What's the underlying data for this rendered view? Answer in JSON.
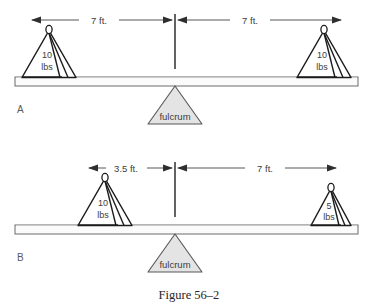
{
  "figure": {
    "caption": "Figure 56–2",
    "panels": [
      {
        "id": "A",
        "label": "A",
        "balanced": true,
        "fulcrum_label": "fulcrum",
        "dimensions": [
          {
            "side": "left",
            "label": "7 ft."
          },
          {
            "side": "right",
            "label": "7 ft."
          }
        ],
        "weights": [
          {
            "side": "left",
            "value": "10",
            "unit": "lbs",
            "size": "large"
          },
          {
            "side": "right",
            "value": "10",
            "unit": "lbs",
            "size": "large"
          }
        ]
      },
      {
        "id": "B",
        "label": "B",
        "balanced": true,
        "fulcrum_label": "fulcrum",
        "dimensions": [
          {
            "side": "left",
            "label": "3.5 ft."
          },
          {
            "side": "right",
            "label": "7 ft."
          }
        ],
        "weights": [
          {
            "side": "left",
            "value": "10",
            "unit": "lbs",
            "size": "large"
          },
          {
            "side": "right",
            "value": "5",
            "unit": "lbs",
            "size": "small"
          }
        ]
      }
    ]
  },
  "colors": {
    "line": "#1c1c1c",
    "dimension": "#55565a",
    "fulcrum_fill": "#e4e4e4",
    "beam_fill": "#fbfbfb",
    "text": "#3d3d3d",
    "background": "#ffffff"
  }
}
